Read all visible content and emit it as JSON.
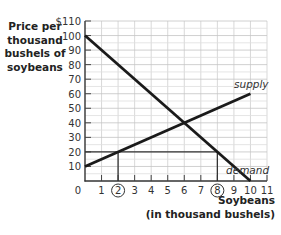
{
  "chart_data": {
    "type": "line",
    "title": "",
    "ylabel_lines": [
      "Price per",
      "thousand",
      "bushels of",
      "soybeans"
    ],
    "xlabel_lines": [
      "Soybeans",
      "(in thousand bushels)"
    ],
    "xlim": [
      0,
      11
    ],
    "ylim": [
      0,
      110
    ],
    "x_ticks": [
      0,
      1,
      2,
      3,
      4,
      5,
      6,
      7,
      8,
      9,
      10,
      11
    ],
    "x_tick_labels": [
      "0",
      "1",
      "2",
      "3",
      "4",
      "5",
      "6",
      "7",
      "8",
      "9",
      "10",
      "11"
    ],
    "circled_x_ticks": [
      2,
      8
    ],
    "y_ticks": [
      10,
      20,
      30,
      40,
      50,
      60,
      70,
      80,
      90,
      100,
      110
    ],
    "y_tick_labels": [
      "10",
      "20",
      "30",
      "40",
      "50",
      "60",
      "70",
      "80",
      "90",
      "100",
      "$110"
    ],
    "grid": true,
    "series": [
      {
        "name": "supply",
        "label": "supply",
        "x": [
          0,
          10
        ],
        "y": [
          10,
          60
        ]
      },
      {
        "name": "demand",
        "label": "demand",
        "x": [
          0,
          10
        ],
        "y": [
          100,
          0
        ]
      }
    ],
    "annotations": [
      {
        "type": "hline",
        "y": 20,
        "x_from": 0,
        "x_to": 8,
        "note": "price floor at $20"
      },
      {
        "type": "vline",
        "x": 2,
        "y_from": 0,
        "y_to": 20,
        "note": "quantity demanded... supply at price 20"
      },
      {
        "type": "vline",
        "x": 8,
        "y_from": 0,
        "y_to": 20,
        "note": "quantity demanded at price 20"
      }
    ],
    "equilibrium": {
      "x": 6,
      "y": 40
    }
  }
}
